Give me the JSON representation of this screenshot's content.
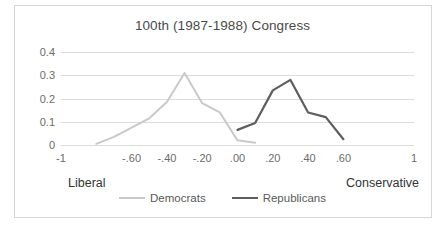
{
  "chart_data": {
    "type": "line",
    "title": "100th (1987-1988) Congress",
    "xlabel": "",
    "ylabel": "",
    "xlim": [
      -1,
      1
    ],
    "ylim": [
      0,
      0.4
    ],
    "grid": true,
    "legend_position": "bottom",
    "x_tick_labels": [
      "-1",
      "-.60",
      "-.40",
      "-.20",
      ".00",
      ".20",
      ".40",
      ".60",
      "1"
    ],
    "x_tick_values": [
      -1,
      -0.6,
      -0.4,
      -0.2,
      0.0,
      0.2,
      0.4,
      0.6,
      1
    ],
    "y_tick_labels": [
      "0.4",
      "0.3",
      "0.2",
      "0.1",
      "0"
    ],
    "y_tick_values": [
      0.4,
      0.3,
      0.2,
      0.1,
      0
    ],
    "axis_end_labels": {
      "left": "Liberal",
      "right": "Conservative"
    },
    "series": [
      {
        "name": "Democrats",
        "color": "#c9c9c9",
        "x": [
          -0.8,
          -0.7,
          -0.6,
          -0.5,
          -0.4,
          -0.3,
          -0.2,
          -0.1,
          0.0,
          0.1
        ],
        "values": [
          0.005,
          0.035,
          0.075,
          0.115,
          0.185,
          0.31,
          0.18,
          0.14,
          0.02,
          0.01
        ]
      },
      {
        "name": "Republicans",
        "color": "#5e5e5e",
        "x": [
          0.0,
          0.1,
          0.2,
          0.3,
          0.4,
          0.5,
          0.6
        ],
        "values": [
          0.065,
          0.095,
          0.235,
          0.28,
          0.14,
          0.12,
          0.025
        ]
      }
    ],
    "legend": [
      {
        "label": "Democrats",
        "color": "#c9c9c9"
      },
      {
        "label": "Republicans",
        "color": "#5e5e5e"
      }
    ],
    "colors": {
      "grid": "#dcdcdc",
      "border": "#d6d6d6",
      "title_text": "#4a4a4a",
      "tick_text": "#6b6b6b",
      "pole_text": "#333333",
      "background": "#ffffff"
    }
  }
}
